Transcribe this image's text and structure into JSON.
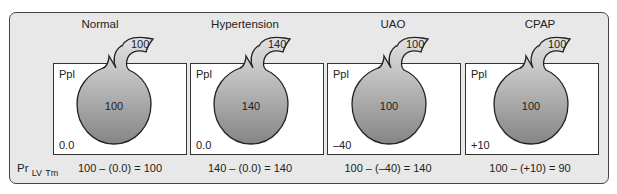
{
  "diagram": {
    "row_label": {
      "main": "Pr",
      "sub1": "LV",
      "sub2": "Tm"
    },
    "box_label": "Ppl",
    "panels": [
      {
        "title": "Normal",
        "intracavitary": "100",
        "neck": "100",
        "pleural": "0.0",
        "formula": "100 – (0.0) = 100"
      },
      {
        "title": "Hypertension",
        "intracavitary": "140",
        "neck": "140",
        "pleural": "0.0",
        "formula": "140 – (0.0) = 140"
      },
      {
        "title": "UAO",
        "intracavitary": "100",
        "neck": "100",
        "pleural": "–40",
        "formula": "100 – (–40) = 140"
      },
      {
        "title": "CPAP",
        "intracavitary": "100",
        "neck": "100",
        "pleural": "+10",
        "formula": "100 – (+10) = 90"
      }
    ],
    "colors": {
      "frame_bg": "#e8e8e8",
      "ventricle_light": "#dcdcdc",
      "ventricle_dark": "#8a8a8a"
    }
  }
}
